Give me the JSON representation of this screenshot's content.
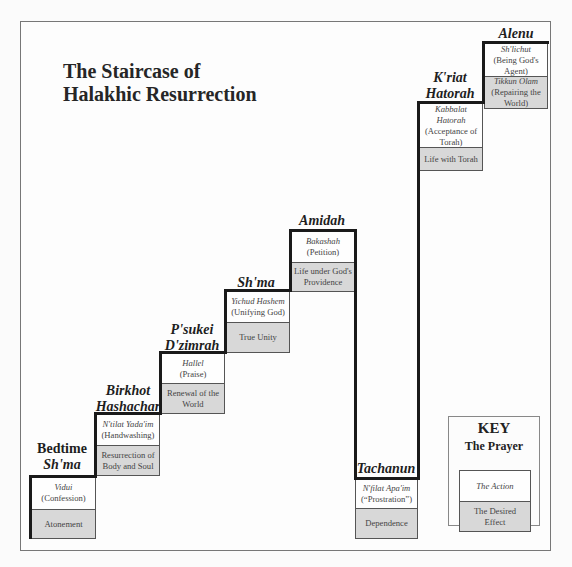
{
  "title": {
    "line1": "The Staircase of",
    "line2": "Halakhic Resurrection"
  },
  "steps": [
    {
      "prayer_line1": "Bedtime",
      "prayer_line2": "Sh'ma",
      "action_name": "Vidui",
      "action_gloss": "(Confession)",
      "effect": "Atonement"
    },
    {
      "prayer_line1": "Birkhot",
      "prayer_line2": "Hashachar",
      "action_name": "N'tilat Yada'im",
      "action_gloss": "(Handwashing)",
      "effect": "Resurrection of Body and Soul"
    },
    {
      "prayer_line1": "P'sukei",
      "prayer_line2": "D'zimrah",
      "action_name": "Hallel",
      "action_gloss": "(Praise)",
      "effect": "Renewal of the World"
    },
    {
      "prayer_line1": "Sh'ma",
      "prayer_line2": "",
      "action_name": "Yichud Hashem",
      "action_gloss": "(Unifying God)",
      "effect": "True Unity"
    },
    {
      "prayer_line1": "Amidah",
      "prayer_line2": "",
      "action_name": "Bakashah",
      "action_gloss": "(Petition)",
      "effect": "Life under God's Providence"
    },
    {
      "prayer_line1": "Tachanun",
      "prayer_line2": "",
      "action_name": "N'filat Apa'im",
      "action_gloss": "(“Prostration”)",
      "effect": "Dependence"
    },
    {
      "prayer_line1": "K'riat",
      "prayer_line2": "Hatorah",
      "action_name": "Kabbalat Hatorah",
      "action_gloss": "(Acceptance of Torah)",
      "effect": "Life with Torah"
    },
    {
      "prayer_line1": "Alenu",
      "prayer_line2": "",
      "action_name": "Sh'lichut",
      "action_gloss": "(Being God's Agent)",
      "effect_name": "Tikkun Olam",
      "effect": "(Repairing the World)"
    }
  ],
  "key": {
    "title": "KEY",
    "subtitle": "The Prayer",
    "action_label": "The Action",
    "effect_label": "The Desired Effect"
  },
  "colors": {
    "effect_fill": "#d8d8d8",
    "action_fill": "#fefefe",
    "stair_line": "#1a1a1a"
  }
}
